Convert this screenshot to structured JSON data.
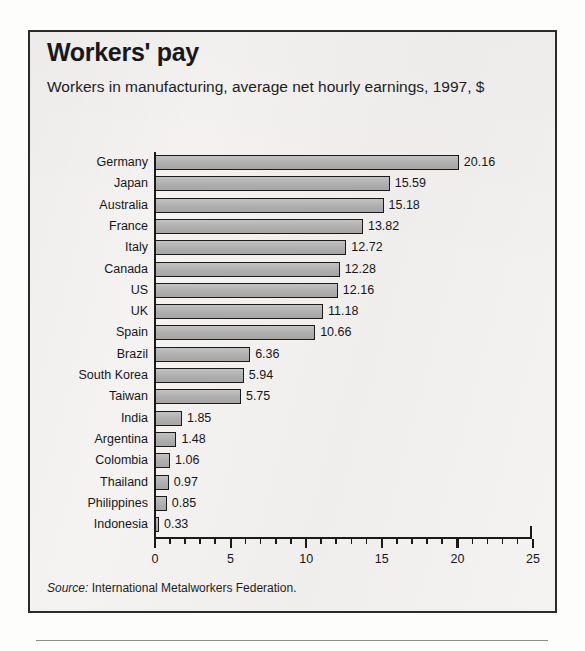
{
  "figure": {
    "title": "Workers' pay",
    "subtitle": "Workers in manufacturing, average net hourly earnings, 1997, $",
    "source_prefix": "Source:",
    "source_text": "International Metalworkers Federation.",
    "colors": {
      "bar_fill": "#b4b4b4",
      "bar_border": "#1a1a1a",
      "text": "#16161a",
      "frame": "#2b2b2b",
      "background": "#f4f3f1"
    }
  },
  "chart_data": {
    "type": "bar",
    "orientation": "horizontal",
    "title": "Workers' pay",
    "subtitle": "Workers in manufacturing, average net hourly earnings, 1997, $",
    "xlabel": "",
    "ylabel": "",
    "xlim": [
      0,
      25
    ],
    "xticks": [
      0,
      5,
      10,
      15,
      20,
      25
    ],
    "xtick_labels": [
      "0",
      "5",
      "10",
      "15",
      "20",
      "25"
    ],
    "minor_tick_interval": 1,
    "grid": false,
    "legend": false,
    "value_labels": true,
    "units": "US$ per hour",
    "year": 1997,
    "source": "Source: International Metalworkers Federation.",
    "categories": [
      "Germany",
      "Japan",
      "Australia",
      "France",
      "Italy",
      "Canada",
      "US",
      "UK",
      "Spain",
      "Brazil",
      "South Korea",
      "Taiwan",
      "India",
      "Argentina",
      "Colombia",
      "Thailand",
      "Philippines",
      "Indonesia"
    ],
    "values": [
      20.16,
      15.59,
      15.18,
      13.82,
      12.72,
      12.28,
      12.16,
      11.18,
      10.66,
      6.36,
      5.94,
      5.75,
      1.85,
      1.48,
      1.06,
      0.97,
      0.85,
      0.33
    ],
    "value_label_text": [
      "20.16",
      "15.59",
      "15.18",
      "13.82",
      "12.72",
      "12.28",
      "12.16",
      "11.18",
      "10.66",
      "6.36",
      "5.94",
      "5.75",
      "1.85",
      "1.48",
      "1.06",
      "0.97",
      "0.85",
      "0.33"
    ]
  }
}
